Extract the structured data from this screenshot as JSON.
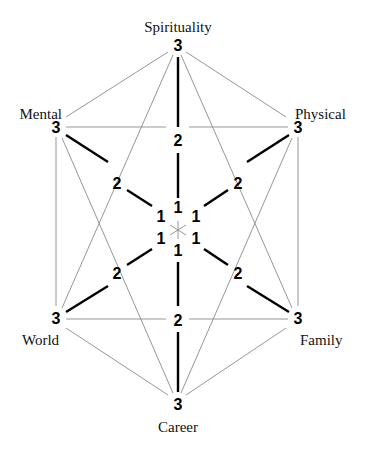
{
  "diagram": {
    "type": "hexagonal-radar",
    "center": [
      178,
      230
    ],
    "axes": [
      {
        "name": "Spirituality",
        "angle": -90
      },
      {
        "name": "Physical",
        "angle": -30
      },
      {
        "name": "Family",
        "angle": 30
      },
      {
        "name": "Career",
        "angle": 90
      },
      {
        "name": "World",
        "angle": 150
      },
      {
        "name": "Mental",
        "angle": 210
      }
    ],
    "scale_labels": [
      "1",
      "2",
      "3"
    ]
  },
  "labels": {
    "spirituality": "Spirituality",
    "physical": "Physical",
    "family": "Family",
    "career": "Career",
    "world": "World",
    "mental": "Mental",
    "one": "1",
    "two": "2",
    "three": "3"
  },
  "colors": {
    "thick_line": "#000000",
    "thin_line": "#8a8a8a",
    "background": "#ffffff"
  }
}
